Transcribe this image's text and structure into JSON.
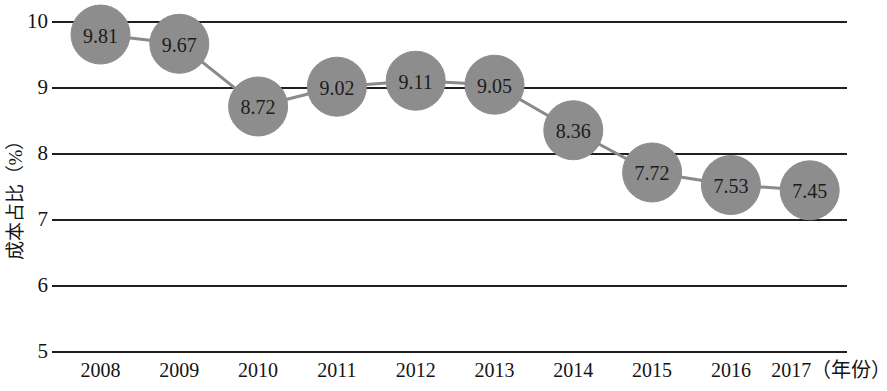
{
  "chart_data": {
    "type": "line",
    "title": "",
    "subtitle": "",
    "xlabel": "年份",
    "ylabel": "成本占比（%）",
    "x_axis_suffix": "（年份）",
    "categories": [
      "2008",
      "2009",
      "2010",
      "2011",
      "2012",
      "2013",
      "2014",
      "2015",
      "2016",
      "2017"
    ],
    "values": [
      9.81,
      9.67,
      8.72,
      9.02,
      9.11,
      9.05,
      8.36,
      7.72,
      7.53,
      7.45
    ],
    "point_labels": [
      "9.81",
      "9.67",
      "8.72",
      "9.02",
      "9.11",
      "9.05",
      "8.36",
      "7.72",
      "7.53",
      "7.45"
    ],
    "ylim": [
      5,
      10
    ],
    "ytick_labels": [
      "10",
      "9",
      "8",
      "7",
      "6",
      "5"
    ],
    "ytick_values": [
      10,
      9,
      8,
      7,
      6,
      5
    ],
    "xtick_labels": [
      "2008",
      "2009",
      "2010",
      "2011",
      "2012",
      "2013",
      "2014",
      "2015",
      "2016",
      "2017（年份）"
    ],
    "grid": true,
    "grid_axis": "y",
    "legend": false,
    "legend_position": "none",
    "series": [
      {
        "name": "成本占比",
        "values": [
          9.81,
          9.67,
          8.72,
          9.02,
          9.11,
          9.05,
          8.36,
          7.72,
          7.53,
          7.45
        ]
      }
    ],
    "colors": {
      "marker_fill": "#8d8d8d",
      "line": "#8a8a8a",
      "gridline": "#1f1f1f",
      "text": "#141414",
      "background": "#ffffff"
    }
  }
}
